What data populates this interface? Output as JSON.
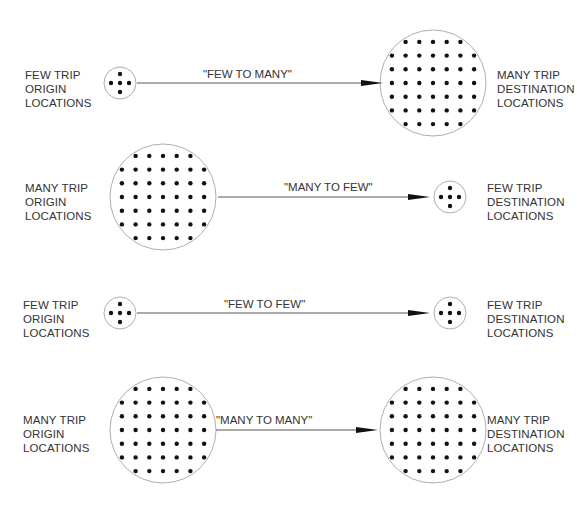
{
  "diagram": {
    "rows": [
      {
        "origin": {
          "type": "few",
          "label": [
            "FEW TRIP",
            "ORIGIN",
            "LOCATIONS"
          ]
        },
        "flow_label": "\"FEW TO MANY\"",
        "destination": {
          "type": "many",
          "label": [
            "MANY TRIP",
            "DESTINATION",
            "LOCATIONS"
          ]
        }
      },
      {
        "origin": {
          "type": "many",
          "label": [
            "MANY TRIP",
            "ORIGIN",
            "LOCATIONS"
          ]
        },
        "flow_label": "\"MANY TO FEW\"",
        "destination": {
          "type": "few",
          "label": [
            "FEW TRIP",
            "DESTINATION",
            "LOCATIONS"
          ]
        }
      },
      {
        "origin": {
          "type": "few",
          "label": [
            "FEW TRIP",
            "ORIGIN",
            "LOCATIONS"
          ]
        },
        "flow_label": "\"FEW TO FEW\"",
        "destination": {
          "type": "few",
          "label": [
            "FEW TRIP",
            "DESTINATION",
            "LOCATIONS"
          ]
        }
      },
      {
        "origin": {
          "type": "many",
          "label": [
            "MANY TRIP",
            "ORIGIN",
            "LOCATIONS"
          ]
        },
        "flow_label": "\"MANY TO MANY\"",
        "destination": {
          "type": "many",
          "label": [
            "MANY TRIP",
            "DESTINATION",
            "LOCATIONS"
          ]
        }
      }
    ],
    "colors": {
      "line": "#444444",
      "dot": "#111111",
      "circle": "#999999",
      "text": "#333333"
    }
  }
}
